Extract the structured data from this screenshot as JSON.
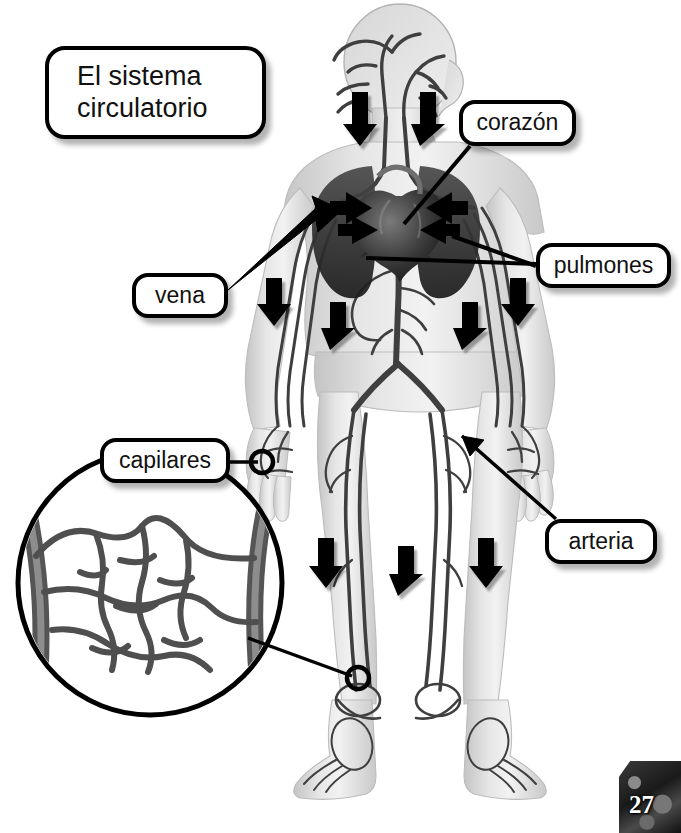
{
  "page": {
    "title": "El sistema\ncirculatorio",
    "number": "27",
    "language": "es"
  },
  "labels": {
    "heart": "corazón",
    "lungs": "pulmones",
    "vein": "vena",
    "artery": "arteria",
    "capillaries": "capilares"
  },
  "diagram": {
    "figure": "full-body-anatomical-figure",
    "inset": "capillary-bed-magnifier",
    "flow_arrows": 10,
    "marker_circles": 2,
    "colors": {
      "outline": "#000000",
      "body_fill": "#d8d8d8",
      "vessel_dark": "#3a3a3a",
      "vessel_mid": "#6e6e6e",
      "organ_dark": "#2b2b2b",
      "callout_fill": "#ffffff",
      "background": "#ffffff"
    }
  }
}
